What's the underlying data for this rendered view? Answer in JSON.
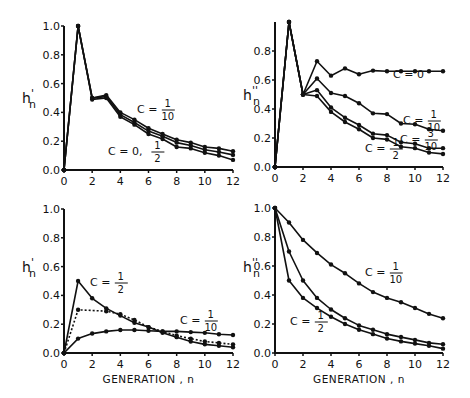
{
  "figure": {
    "xlabel": "GENERATION , n"
  },
  "chart_data": [
    {
      "id": "top-left",
      "type": "line",
      "title": "",
      "ylabel": "h'n",
      "ylabel_main": "h",
      "ylabel_sup": "'",
      "ylabel_sub": "n",
      "xlabel": "",
      "xlim": [
        0,
        12
      ],
      "ylim": [
        0,
        1.0
      ],
      "xticks": [
        "0",
        "2",
        "4",
        "6",
        "8",
        "10",
        "12"
      ],
      "yticks": [
        "0.0",
        "0.2",
        "0.4",
        "0.6",
        "0.8",
        "1.0"
      ],
      "grid": false,
      "x": [
        0,
        1,
        2,
        3,
        4,
        5,
        6,
        7,
        8,
        9,
        10,
        11,
        12
      ],
      "series": [
        {
          "name": "C = 1/10",
          "style": "solid",
          "values": [
            0.0,
            1.0,
            0.5,
            0.52,
            0.4,
            0.35,
            0.29,
            0.25,
            0.21,
            0.19,
            0.16,
            0.15,
            0.13
          ]
        },
        {
          "name": "C = 0 (middle)",
          "style": "solid",
          "values": [
            0.0,
            1.0,
            0.5,
            0.51,
            0.385,
            0.33,
            0.27,
            0.235,
            0.19,
            0.17,
            0.14,
            0.125,
            0.105
          ]
        },
        {
          "name": "C = 1/2",
          "style": "solid",
          "values": [
            0.0,
            1.0,
            0.49,
            0.5,
            0.37,
            0.315,
            0.25,
            0.215,
            0.16,
            0.15,
            0.12,
            0.1,
            0.07
          ]
        }
      ],
      "annotations": [
        {
          "text": "C = ",
          "num": "1",
          "den": "10",
          "x": 137,
          "y": 113
        },
        {
          "text": "C = 0, ",
          "num": "1",
          "den": "2",
          "x": 108,
          "y": 155
        }
      ]
    },
    {
      "id": "top-right",
      "type": "line",
      "title": "",
      "ylabel": "h''n",
      "ylabel_main": "h",
      "ylabel_sup": "''",
      "ylabel_sub": "n",
      "xlabel": "",
      "xlim": [
        0,
        12
      ],
      "ylim": [
        0,
        1.0
      ],
      "xticks": [
        "0",
        "2",
        "4",
        "6",
        "8",
        "10",
        "12"
      ],
      "yticks": [
        "0.0",
        "0.2",
        "0.4",
        "0.6",
        "0.8"
      ],
      "grid": false,
      "x": [
        0,
        1,
        2,
        3,
        4,
        5,
        6,
        7,
        8,
        9,
        10,
        11,
        12
      ],
      "series": [
        {
          "name": "C = 0",
          "style": "solid",
          "values": [
            0.0,
            1.0,
            0.5,
            0.73,
            0.63,
            0.68,
            0.64,
            0.665,
            0.66,
            0.66,
            0.66,
            0.66,
            0.66
          ]
        },
        {
          "name": "C = 1/10",
          "style": "solid",
          "values": [
            0.0,
            1.0,
            0.5,
            0.61,
            0.51,
            0.49,
            0.44,
            0.37,
            0.365,
            0.3,
            0.295,
            0.26,
            0.25
          ]
        },
        {
          "name": "C = 3/10",
          "style": "solid",
          "values": [
            0.0,
            1.0,
            0.5,
            0.53,
            0.41,
            0.34,
            0.29,
            0.23,
            0.22,
            0.17,
            0.16,
            0.13,
            0.13
          ]
        },
        {
          "name": "C = 1/2",
          "style": "solid",
          "values": [
            0.0,
            1.0,
            0.5,
            0.49,
            0.38,
            0.31,
            0.26,
            0.2,
            0.19,
            0.14,
            0.13,
            0.1,
            0.09
          ]
        }
      ],
      "annotations": [
        {
          "text": "C = 0",
          "num": "",
          "den": "",
          "x": 393,
          "y": 78
        },
        {
          "text": "C = ",
          "num": "1",
          "den": "10",
          "x": 403,
          "y": 124
        },
        {
          "text": "C = ",
          "num": "3",
          "den": "10",
          "x": 400,
          "y": 143
        },
        {
          "text": "C = ",
          "num": "1",
          "den": "2",
          "x": 365,
          "y": 152
        }
      ]
    },
    {
      "id": "bottom-left",
      "type": "line",
      "title": "",
      "ylabel": "h'n",
      "ylabel_main": "h",
      "ylabel_sup": "'",
      "ylabel_sub": "n",
      "xlabel": "GENERATION , n",
      "xlim": [
        0,
        12
      ],
      "ylim": [
        0,
        1.0
      ],
      "xticks": [
        "0",
        "2",
        "4",
        "6",
        "8",
        "10",
        "12"
      ],
      "yticks": [
        "0.0",
        "0.2",
        "0.4",
        "0.6",
        "0.8",
        "1.0"
      ],
      "grid": false,
      "x": [
        0,
        1,
        2,
        3,
        4,
        5,
        6,
        7,
        8,
        9,
        10,
        11,
        12
      ],
      "series": [
        {
          "name": "C = 1/2",
          "style": "solid",
          "values": [
            0.0,
            0.5,
            0.38,
            0.31,
            0.26,
            0.21,
            0.18,
            0.14,
            0.11,
            0.08,
            0.06,
            0.05,
            0.04
          ]
        },
        {
          "name": "C = 3/10 (dotted)",
          "style": "dotted",
          "values": [
            0.0,
            0.3,
            null,
            0.29,
            0.27,
            0.23,
            0.18,
            0.15,
            0.12,
            0.1,
            0.08,
            0.07,
            0.06
          ]
        },
        {
          "name": "C = 1/10",
          "style": "solid",
          "values": [
            0.0,
            0.1,
            0.135,
            0.15,
            0.16,
            0.16,
            0.155,
            0.15,
            0.15,
            0.145,
            0.14,
            0.13,
            0.125
          ]
        }
      ],
      "annotations": [
        {
          "text": "C = ",
          "num": "1",
          "den": "2",
          "x": 90,
          "y": 286
        },
        {
          "text": "C = ",
          "num": "1",
          "den": "10",
          "x": 180,
          "y": 324
        }
      ]
    },
    {
      "id": "bottom-right",
      "type": "line",
      "title": "",
      "ylabel": "h''n",
      "ylabel_main": "h",
      "ylabel_sup": "''",
      "ylabel_sub": "n",
      "xlabel": "GENERATION , n",
      "xlim": [
        0,
        12
      ],
      "ylim": [
        0,
        1.0
      ],
      "xticks": [
        "0",
        "2",
        "4",
        "6",
        "8",
        "10",
        "12"
      ],
      "yticks": [
        "0.0",
        "0.2",
        "0.4",
        "0.6",
        "0.8",
        "1.0"
      ],
      "grid": false,
      "x": [
        0,
        1,
        2,
        3,
        4,
        5,
        6,
        7,
        8,
        9,
        10,
        11,
        12
      ],
      "series": [
        {
          "name": "C = 1/10",
          "style": "solid",
          "values": [
            1.0,
            0.9,
            0.78,
            0.69,
            0.61,
            0.55,
            0.48,
            0.42,
            0.38,
            0.35,
            0.31,
            0.27,
            0.24
          ]
        },
        {
          "name": "C = 3/10",
          "style": "solid",
          "values": [
            1.0,
            0.7,
            0.5,
            0.38,
            0.3,
            0.24,
            0.19,
            0.16,
            0.13,
            0.11,
            0.09,
            0.07,
            0.06
          ]
        },
        {
          "name": "C = 1/2",
          "style": "solid",
          "values": [
            1.0,
            0.5,
            0.38,
            0.31,
            0.25,
            0.2,
            0.16,
            0.13,
            0.1,
            0.08,
            0.065,
            0.05,
            0.03
          ]
        }
      ],
      "annotations": [
        {
          "text": "C = ",
          "num": "1",
          "den": "10",
          "x": 365,
          "y": 276
        },
        {
          "text": "C = ",
          "num": "1",
          "den": "2",
          "x": 290,
          "y": 325
        }
      ]
    }
  ],
  "layout": {
    "panels": [
      {
        "x0": 64,
        "x12": 233,
        "y0": 170,
        "y1": 26,
        "ylabX": 22,
        "ylabY": 103,
        "tickMax": 1.0
      },
      {
        "x0": 275,
        "x12": 443,
        "y0": 167,
        "y1": 22,
        "ylabX": 243,
        "ylabY": 100,
        "tickMax": 0.8
      },
      {
        "x0": 64,
        "x12": 233,
        "y0": 353,
        "y1": 209,
        "ylabX": 22,
        "ylabY": 272,
        "tickMax": 1.0
      },
      {
        "x0": 275,
        "x12": 443,
        "y0": 353,
        "y1": 208,
        "ylabX": 243,
        "ylabY": 272,
        "tickMax": 1.0
      }
    ]
  }
}
